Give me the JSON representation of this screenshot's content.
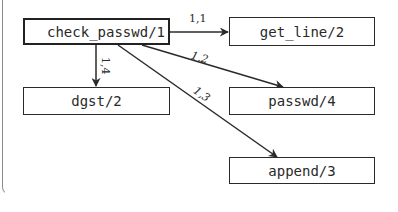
{
  "diagram": {
    "type": "call-graph",
    "nodes": [
      {
        "id": "check_passwd",
        "label": "check_passwd/1",
        "root": true
      },
      {
        "id": "get_line",
        "label": "get_line/2"
      },
      {
        "id": "dgst",
        "label": "dgst/2"
      },
      {
        "id": "passwd",
        "label": "passwd/4"
      },
      {
        "id": "append",
        "label": "append/3"
      }
    ],
    "edges": [
      {
        "from": "check_passwd",
        "to": "get_line",
        "label": "1,1"
      },
      {
        "from": "check_passwd",
        "to": "passwd",
        "label": "1,2"
      },
      {
        "from": "check_passwd",
        "to": "append",
        "label": "1,3"
      },
      {
        "from": "check_passwd",
        "to": "dgst",
        "label": "1,4"
      }
    ],
    "colors": {
      "stroke": "#2a2a2a",
      "frame": "#8a8a8a",
      "background": "#ffffff"
    }
  }
}
